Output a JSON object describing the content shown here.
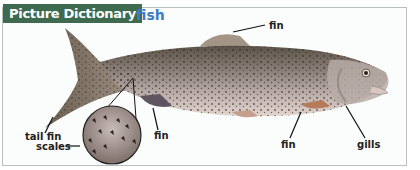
{
  "header": {
    "section_title": "Picture Dictionary",
    "word": "fish"
  },
  "labels": {
    "top_fin": "fin",
    "tail_fin": "tail fin",
    "scales": "scales",
    "belly_fin": "fin",
    "pelvic_fin": "fin",
    "gills": "gills"
  },
  "colors": {
    "banner_bg": "#3e6b4f",
    "word": "#3b7cc4"
  },
  "image": {
    "subject": "trout-illustration"
  }
}
